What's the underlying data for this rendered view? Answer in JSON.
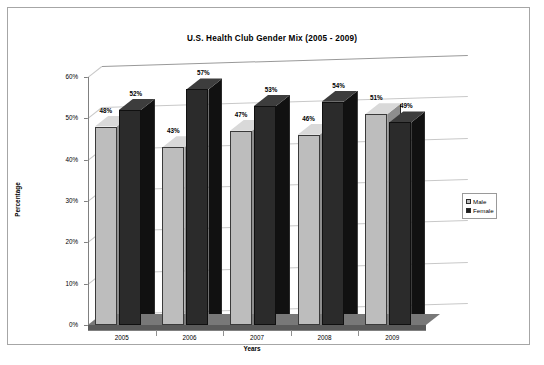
{
  "chart_data": {
    "type": "bar",
    "title": "U.S. Health Club Gender Mix (2005 - 2009)",
    "xlabel": "Years",
    "ylabel": "Percentage",
    "categories": [
      "2005",
      "2006",
      "2007",
      "2008",
      "2009"
    ],
    "series": [
      {
        "name": "Male",
        "values": [
          48,
          43,
          47,
          46,
          51
        ],
        "labels": [
          "48%",
          "43%",
          "47%",
          "46%",
          "51%"
        ],
        "color": "#bdbdbd"
      },
      {
        "name": "Female",
        "values": [
          52,
          57,
          53,
          54,
          49
        ],
        "labels": [
          "52%",
          "57%",
          "53%",
          "54%",
          "49%"
        ],
        "color": "#2b2b2b"
      }
    ],
    "ylim": [
      0,
      60
    ],
    "yticks": [
      0,
      10,
      20,
      30,
      40,
      50,
      60
    ],
    "ytick_labels": [
      "0%",
      "10%",
      "20%",
      "30%",
      "40%",
      "50%",
      "60%"
    ],
    "grid": true,
    "legend_position": "right",
    "style": "3d-column",
    "units": "percent"
  },
  "legend": {
    "items": [
      {
        "label": "Male"
      },
      {
        "label": "Female"
      }
    ]
  }
}
